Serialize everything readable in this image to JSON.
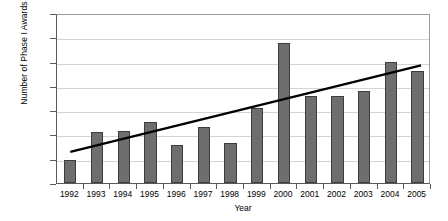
{
  "chart_data": {
    "type": "bar",
    "title": "",
    "xlabel": "Year",
    "ylabel": "Number of Phase I Awards",
    "categories": [
      "1992",
      "1993",
      "1994",
      "1995",
      "1996",
      "1997",
      "1998",
      "1999",
      "2000",
      "2001",
      "2002",
      "2003",
      "2004",
      "2005"
    ],
    "values": [
      95,
      210,
      215,
      250,
      155,
      232,
      165,
      310,
      575,
      360,
      358,
      380,
      497,
      462
    ],
    "series": [
      {
        "name": "Number of Phase I Awards",
        "values": [
          95,
          210,
          215,
          250,
          155,
          232,
          165,
          310,
          575,
          360,
          358,
          380,
          497,
          462
        ]
      }
    ],
    "ylim": [
      0,
      700
    ],
    "ytick_labels": [
      "0",
      "100",
      "200",
      "300",
      "400",
      "500",
      "600",
      "700"
    ],
    "ytick_values": [
      0,
      100,
      200,
      300,
      400,
      500,
      600,
      700
    ],
    "grid": true,
    "legend": "none",
    "bar_color": "#6e6e6e",
    "bar_edge_color": "#3d3d3d",
    "gridline_color": "#d4d4d4",
    "axis_color": "#5a5a5a",
    "trendline": {
      "type": "line",
      "name": "linear trend",
      "color": "#000000",
      "start_value": 130,
      "end_value": 490,
      "start_category": "1992",
      "end_category": "2005"
    }
  }
}
